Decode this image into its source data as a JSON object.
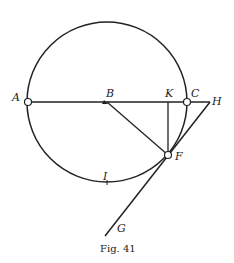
{
  "figure": {
    "caption": "Fig. 41",
    "labels": {
      "A": "A",
      "B": "B",
      "C": "C",
      "K": "K",
      "H": "H",
      "F": "F",
      "I": "I",
      "G": "G"
    }
  }
}
